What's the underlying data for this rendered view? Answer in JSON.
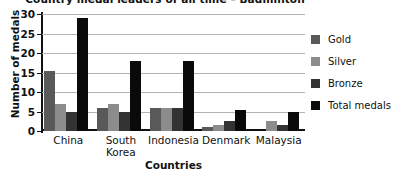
{
  "chart_data": {
    "type": "bar",
    "title": "Country medal leaders of all time – Badminton",
    "xlabel": "Countries",
    "ylabel": "Number of medals",
    "categories": [
      "China",
      "South Korea",
      "Indonesia",
      "Denmark",
      "Malaysia"
    ],
    "series": [
      {
        "name": "Gold",
        "color": "#595959",
        "values": [
          15.5,
          6,
          6,
          1,
          0
        ]
      },
      {
        "name": "Silver",
        "color": "#8c8c8c",
        "values": [
          7,
          7,
          6,
          1.5,
          2.5
        ]
      },
      {
        "name": "Bronze",
        "color": "#333333",
        "values": [
          5,
          5,
          6,
          2.5,
          1.5
        ]
      },
      {
        "name": "Total medals",
        "color": "#0a0a0a",
        "values": [
          29,
          18,
          18,
          5.5,
          5
        ]
      }
    ],
    "yticks": [
      0,
      5,
      10,
      15,
      20,
      25,
      30
    ],
    "ylim": [
      0,
      30
    ],
    "grid": true,
    "legend_position": "right"
  }
}
